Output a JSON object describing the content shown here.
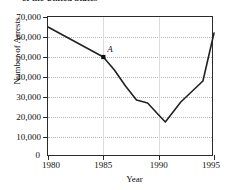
{
  "figure": {
    "title_partial": "of the United States",
    "point_label": "A"
  },
  "chart_data": {
    "type": "line",
    "title": "of the United States",
    "xlabel": "Year",
    "ylabel": "Number of Arrests",
    "xlim": [
      1980,
      1995
    ],
    "ylim": [
      0,
      70000
    ],
    "grid": true,
    "legend": null,
    "xticks": [
      1980,
      1985,
      1990,
      1995
    ],
    "xticklabels": [
      "1980",
      "1985",
      "1990",
      "1995"
    ],
    "yticks": [
      0,
      10000,
      20000,
      30000,
      40000,
      50000,
      60000,
      70000
    ],
    "yticklabels": [
      "0",
      "10,000",
      "20,000",
      "30,000",
      "40,000",
      "50,000",
      "60,000",
      "70,000"
    ],
    "x": [
      1980,
      1985,
      1986,
      1987,
      1988,
      1989,
      1990,
      1990.6,
      1992,
      1994,
      1995
    ],
    "values": [
      65000,
      50000,
      43500,
      35500,
      28500,
      27000,
      21000,
      17500,
      27500,
      38000,
      62000
    ],
    "annotations": [
      {
        "label": "A",
        "x": 1985,
        "y": 50000,
        "marker": "square"
      }
    ]
  }
}
